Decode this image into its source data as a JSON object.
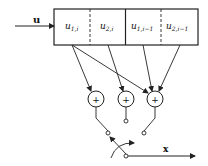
{
  "diagram": {
    "input_label": "u",
    "output_label": "x",
    "cells": [
      {
        "label": "u",
        "sub": "1,i"
      },
      {
        "label": "u",
        "sub": "2,i"
      },
      {
        "label": "u",
        "sub": "1,i−1"
      },
      {
        "label": "u",
        "sub": "2,i−1"
      }
    ],
    "adders": [
      {
        "symbol": "+"
      },
      {
        "symbol": "+"
      },
      {
        "symbol": "+"
      }
    ],
    "colors": {
      "stroke": "#222222",
      "background": "#ffffff"
    }
  }
}
